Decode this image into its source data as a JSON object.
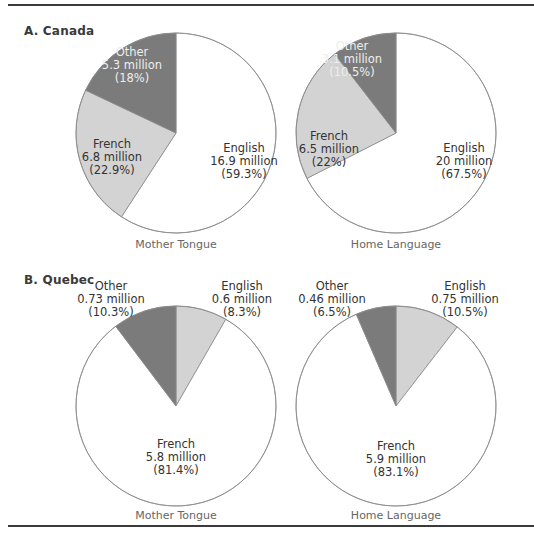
{
  "figure": {
    "sections": [
      {
        "label": "A. Canada"
      },
      {
        "label": "B. Quebec"
      }
    ]
  },
  "chart_data": [
    {
      "type": "pie",
      "section": "A. Canada",
      "title": "Mother Tongue",
      "slices": [
        {
          "label": "English",
          "value_millions": 16.9,
          "value_text": "16.9 million",
          "percent": 59.3,
          "percent_text": "(59.3%)",
          "color": "#ffffff"
        },
        {
          "label": "French",
          "value_millions": 6.8,
          "value_text": "6.8 million",
          "percent": 22.9,
          "percent_text": "(22.9%)",
          "color": "#d3d3d3"
        },
        {
          "label": "Other",
          "value_millions": 5.3,
          "value_text": "5.3 million",
          "percent": 18,
          "percent_text": "(18%)",
          "color": "#7b7b7b"
        }
      ]
    },
    {
      "type": "pie",
      "section": "A. Canada",
      "title": "Home Language",
      "slices": [
        {
          "label": "English",
          "value_millions": 20,
          "value_text": "20 million",
          "percent": 67.5,
          "percent_text": "(67.5%)",
          "color": "#ffffff"
        },
        {
          "label": "French",
          "value_millions": 6.5,
          "value_text": "6.5 million",
          "percent": 22,
          "percent_text": "(22%)",
          "color": "#d3d3d3"
        },
        {
          "label": "Other",
          "value_millions": 3.1,
          "value_text": "3.1 million",
          "percent": 10.5,
          "percent_text": "(10.5%)",
          "color": "#7b7b7b"
        }
      ]
    },
    {
      "type": "pie",
      "section": "B. Quebec",
      "title": "Mother Tongue",
      "slices": [
        {
          "label": "English",
          "value_millions": 0.6,
          "value_text": "0.6 million",
          "percent": 8.3,
          "percent_text": "(8.3%)",
          "color": "#d3d3d3"
        },
        {
          "label": "French",
          "value_millions": 5.8,
          "value_text": "5.8 million",
          "percent": 81.4,
          "percent_text": "(81.4%)",
          "color": "#ffffff"
        },
        {
          "label": "Other",
          "value_millions": 0.73,
          "value_text": "0.73 million",
          "percent": 10.3,
          "percent_text": "(10.3%)",
          "color": "#7b7b7b"
        }
      ]
    },
    {
      "type": "pie",
      "section": "B. Quebec",
      "title": "Home Language",
      "slices": [
        {
          "label": "English",
          "value_millions": 0.75,
          "value_text": "0.75 million",
          "percent": 10.5,
          "percent_text": "(10.5%)",
          "color": "#d3d3d3"
        },
        {
          "label": "French",
          "value_millions": 5.9,
          "value_text": "5.9 million",
          "percent": 83.1,
          "percent_text": "(83.1%)",
          "color": "#ffffff"
        },
        {
          "label": "Other",
          "value_millions": 0.46,
          "value_text": "0.46 million",
          "percent": 6.5,
          "percent_text": "(6.5%)",
          "color": "#7b7b7b"
        }
      ]
    }
  ]
}
